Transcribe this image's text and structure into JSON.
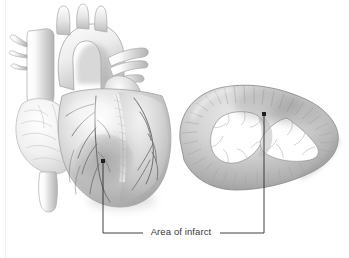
{
  "figure": {
    "title": "Area of infarct",
    "background_color": "#ffffff",
    "width": 349,
    "height": 258
  },
  "callout": {
    "label": "Area of infarct",
    "text_color": "#3a3a3a",
    "line_color": "#2a2a2a",
    "left_pointer": {
      "dot_x": 103,
      "dot_y": 161,
      "elbow_y": 233,
      "end_x": 143
    },
    "right_pointer": {
      "dot_x": 264,
      "dot_y": 114,
      "elbow_y": 233,
      "end_x": 220
    }
  },
  "illustrations": {
    "anterior_heart": {
      "name": "anterior-view-heart",
      "regions": [
        "aortic arch",
        "brachiocephalic trunk",
        "left common carotid artery",
        "left subclavian artery",
        "superior vena cava",
        "pulmonary trunk",
        "right pulmonary veins",
        "left atrial appendage",
        "right ventricle",
        "left ventricle",
        "anterior interventricular coronary artery",
        "right coronary artery",
        "inferior vena cava",
        "apex of heart",
        "infarcted myocardium"
      ]
    },
    "cross_section": {
      "name": "transverse-cross-section",
      "regions": [
        "left ventricle cavity",
        "right ventricle cavity",
        "interventricular septum",
        "myocardial wall",
        "trabeculae carneae",
        "infarcted myocardium"
      ]
    }
  },
  "palette": {
    "tissue_light": "#f4f4f4",
    "tissue_mid": "#cfcfcf",
    "tissue_dark": "#9a9a9a",
    "tissue_shadow": "#7d7d7d",
    "infarct": "#8f8f8f",
    "vessel_line": "#6b6b6b",
    "outline": "#8a8a8a"
  }
}
